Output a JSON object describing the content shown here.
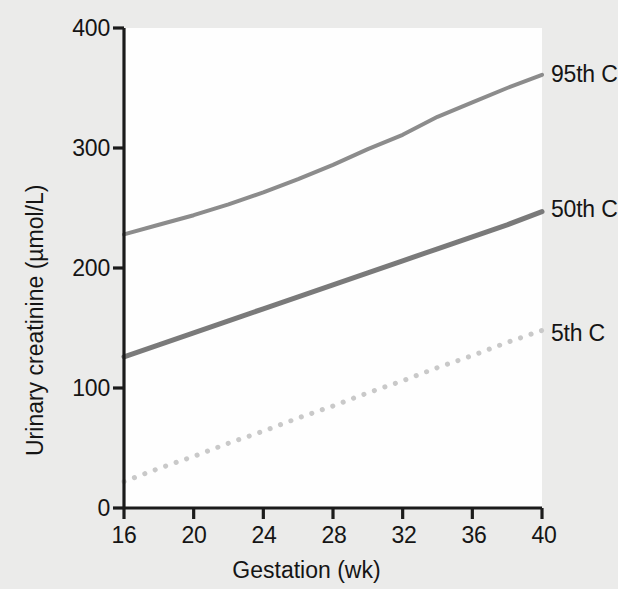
{
  "figure": {
    "background_color": "#ebebea",
    "plot_background_color": "#fefefe",
    "axis_color": "#1b1b1b"
  },
  "chart_data": {
    "type": "line",
    "title": "",
    "subtitle": "",
    "xlabel": "Gestation (wk)",
    "ylabel": "Urinary creatinine (µmol/L)",
    "xlim": [
      16,
      40
    ],
    "ylim": [
      0,
      400
    ],
    "xticks": [
      16,
      20,
      24,
      28,
      32,
      36,
      40
    ],
    "xtick_labels": [
      "16",
      "20",
      "24",
      "28",
      "32",
      "36",
      "40"
    ],
    "yticks": [
      0,
      100,
      200,
      300,
      400
    ],
    "ytick_labels": [
      "0",
      "100",
      "200",
      "300",
      "400"
    ],
    "grid": false,
    "legend_position": "right-inline-annotations",
    "x": [
      16,
      18,
      20,
      22,
      24,
      26,
      28,
      30,
      32,
      34,
      36,
      38,
      40
    ],
    "series": [
      {
        "name": "95th C",
        "label": "95th C",
        "color": "#8c8c8c",
        "linestyle": "solid",
        "linewidth": 4,
        "values": [
          228,
          236,
          244,
          253,
          263,
          274,
          286,
          299,
          311,
          326,
          338,
          350,
          361
        ]
      },
      {
        "name": "50th C",
        "label": "50th C",
        "color": "#7a7a7a",
        "linestyle": "solid",
        "linewidth": 5,
        "values": [
          126,
          136,
          146,
          156,
          166,
          176,
          186,
          196,
          206,
          216,
          226,
          236,
          247
        ]
      },
      {
        "name": "5th C",
        "label": "5th C",
        "color": "#c9c9c9",
        "linestyle": "dotted",
        "linewidth": 5,
        "values": [
          22,
          33,
          43,
          54,
          64,
          75,
          85,
          96,
          106,
          117,
          127,
          138,
          148
        ]
      }
    ]
  },
  "annotations": {
    "label_95th": "95th C",
    "label_50th": "50th C",
    "label_5th": "5th C"
  }
}
